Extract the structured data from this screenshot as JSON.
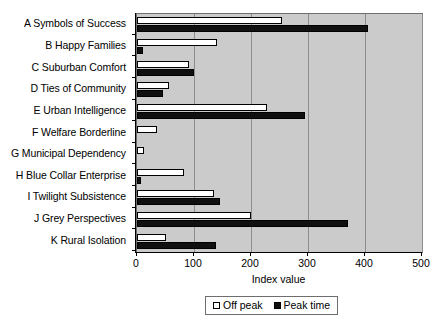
{
  "chart_data": {
    "type": "bar",
    "orientation": "horizontal",
    "title": "",
    "xlabel": "Index value",
    "ylabel": "",
    "xlim": [
      0,
      500
    ],
    "xticks": [
      0,
      100,
      200,
      300,
      400,
      500
    ],
    "xtick_labels": [
      "0",
      "100",
      "200",
      "300",
      "400",
      "500"
    ],
    "grid": true,
    "grid_axis": "x",
    "legend_position": "bottom",
    "plot_background": "#cbcbcb",
    "categories": [
      "A Symbols of Success",
      "B Happy Families",
      "C Suburban Comfort",
      "D Ties of Community",
      "E Urban Intelligence",
      "F Welfare Borderline",
      "G Municipal Dependency",
      "H Blue Collar Enterprise",
      "I Twilight Subsistence",
      "J Grey Perspectives",
      "K Rural Isolation"
    ],
    "series": [
      {
        "name": "Off peak",
        "color": "#ffffff",
        "values": [
          255,
          140,
          92,
          57,
          228,
          35,
          12,
          83,
          135,
          200,
          50
        ]
      },
      {
        "name": "Peak time",
        "color": "#101010",
        "values": [
          405,
          10,
          100,
          45,
          295,
          0,
          0,
          7,
          145,
          370,
          138
        ]
      }
    ]
  },
  "legend": {
    "entries": [
      {
        "label": "Off peak",
        "swatch": "hollow-square"
      },
      {
        "label": "Peak time",
        "swatch": "filled-square"
      }
    ]
  }
}
